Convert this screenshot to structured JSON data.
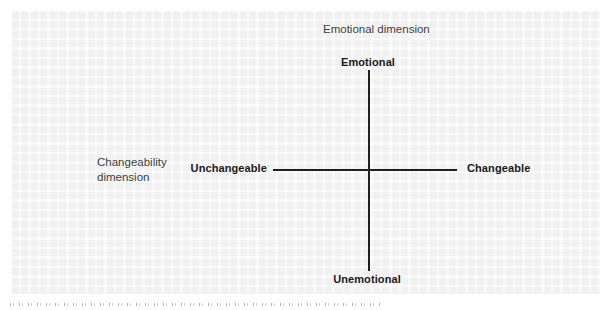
{
  "figure": {
    "vertical_axis": {
      "dimension_label": "Emotional dimension",
      "top_pole": "Emotional",
      "bottom_pole": "Unemotional"
    },
    "horizontal_axis": {
      "dimension_label": "Changeability dimension",
      "dimension_label_lines": [
        "Changeability",
        "dimension"
      ],
      "left_pole": "Unchangeable",
      "right_pole": "Changeable"
    },
    "colors": {
      "axis_line": "#1f1f1f",
      "pole_label_text": "#1a1a1a",
      "dimension_label_text": "#3d3d3d",
      "background": "#ffffff"
    }
  }
}
